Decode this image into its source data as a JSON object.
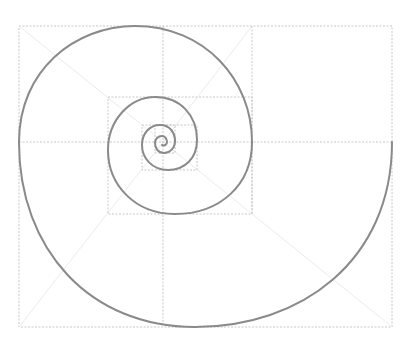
{
  "diagram": {
    "type": "golden-spiral",
    "colors": {
      "background": "#ffffff",
      "grid": "#c8c8c8",
      "diagonal": "#ececec",
      "spiral": "#8a8a8a"
    },
    "outer_rect": {
      "x": 19,
      "y": 26,
      "w": 373,
      "h": 301
    },
    "grid_lines": [
      {
        "x1": 19,
        "y1": 142,
        "x2": 392,
        "y2": 142
      },
      {
        "x1": 163,
        "y1": 26,
        "x2": 163,
        "y2": 327
      },
      {
        "x1": 252,
        "y1": 26,
        "x2": 252,
        "y2": 214
      }
    ],
    "rects": [
      {
        "x": 108,
        "y": 97,
        "w": 144,
        "h": 117
      },
      {
        "x": 142,
        "y": 125,
        "w": 55,
        "h": 45
      },
      {
        "x": 155,
        "y": 125,
        "w": 20,
        "h": 28
      }
    ],
    "diagonals": [
      {
        "x1": 19,
        "y1": 26,
        "x2": 163,
        "y2": 142
      },
      {
        "x1": 252,
        "y1": 26,
        "x2": 163,
        "y2": 142
      },
      {
        "x1": 19,
        "y1": 327,
        "x2": 163,
        "y2": 142
      },
      {
        "x1": 392,
        "y1": 327,
        "x2": 163,
        "y2": 142
      }
    ],
    "spiral_path": "M392,142 C392,262 300,327 195,327 C90,327 19,250 19,142 C19,70 75,26 135,26 C205,26 252,80 252,142 C252,185 220,214 175,214 C135,214 108,185 108,150 C108,120 130,97 155,97 C180,97 197,115 197,140 C197,158 185,170 168,170 C152,170 142,158 142,145 C142,133 150,125 160,125 C170,125 175,133 175,141 C175,148 170,153 164,153 C158,153 155,148 155,143 C155,139 158,136 162,136 C165,136 167,139 167,142 C167,145 164,146 162,145"
  }
}
